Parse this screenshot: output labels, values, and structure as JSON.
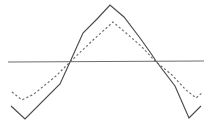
{
  "figure": {
    "title": "",
    "width": 212,
    "height": 125,
    "background_color": "#ffffff"
  },
  "chart_data": {
    "type": "line",
    "title": "",
    "subtitle": "",
    "xlabel": "",
    "ylabel": "",
    "xlim": [
      0,
      212
    ],
    "ylim": [
      125,
      0
    ],
    "grid": false,
    "legend": "none",
    "axes_visible": false,
    "tick_labels_x": [],
    "tick_labels_y": [],
    "annotations": [],
    "series": [
      {
        "name": "solid-waveform",
        "style": "solid",
        "color": "#4a4a4a",
        "linewidth": 1.15,
        "points": [
          [
            11,
            106
          ],
          [
            25,
            119
          ],
          [
            60,
            84
          ],
          [
            70,
            62
          ],
          [
            83,
            33
          ],
          [
            97,
            19
          ],
          [
            110,
            5
          ],
          [
            124,
            17
          ],
          [
            140,
            38
          ],
          [
            150,
            52
          ],
          [
            156,
            61
          ],
          [
            175,
            86
          ],
          [
            189,
            118
          ],
          [
            201,
            106
          ]
        ]
      },
      {
        "name": "dashed-waveform",
        "style": "dashed",
        "color": "#6b6b6b",
        "linewidth": 1.15,
        "dash_pattern": "2.2 2.2",
        "points": [
          [
            12,
            92
          ],
          [
            22,
            100
          ],
          [
            34,
            94
          ],
          [
            56,
            76
          ],
          [
            70,
            62
          ],
          [
            92,
            41
          ],
          [
            102,
            32
          ],
          [
            113,
            22
          ],
          [
            126,
            33
          ],
          [
            141,
            46
          ],
          [
            155,
            61
          ],
          [
            172,
            75
          ],
          [
            186,
            90
          ],
          [
            196,
            98
          ],
          [
            203,
            92
          ]
        ]
      }
    ],
    "reference_line": {
      "name": "baseline",
      "style": "solid",
      "color": "#6e6e6e",
      "linewidth": 1.15,
      "points": [
        [
          8,
          62
        ],
        [
          204,
          61
        ]
      ]
    },
    "crossings": [
      [
        70,
        62
      ],
      [
        155,
        61
      ]
    ]
  }
}
